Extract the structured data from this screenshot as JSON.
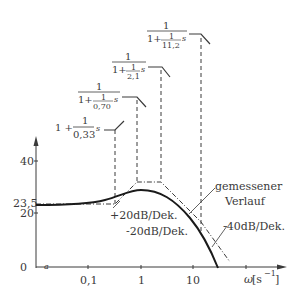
{
  "diagram": {
    "type": "bode-magnitude-plot",
    "y_axis": {
      "ticks": [
        {
          "label": "40",
          "value": 40
        },
        {
          "label": "23,5",
          "value": 23.5
        },
        {
          "label": "20",
          "value": 20
        },
        {
          "label": "0",
          "value": 0
        }
      ]
    },
    "x_axis": {
      "label_omega": "ω",
      "label_unit": "[s",
      "label_exp": "−1",
      "label_close": "]",
      "origin_mark": "a",
      "ticks": [
        {
          "label": "0,1",
          "value": 0.1
        },
        {
          "label": "1",
          "value": 1
        },
        {
          "label": "10",
          "value": 10
        }
      ]
    },
    "factors": [
      {
        "prefix": "1 +",
        "num": "1",
        "den": "0,33",
        "suffix": "s",
        "type": "zero",
        "corner": 0.33
      },
      {
        "top": "1",
        "bottom_prefix": "1+",
        "num": "1",
        "den": "0,70",
        "suffix": "s",
        "type": "pole",
        "corner": 0.7
      },
      {
        "top": "1",
        "bottom_prefix": "1+",
        "num": "1",
        "den": "2,1",
        "suffix": "s",
        "type": "pole",
        "corner": 2.1
      },
      {
        "top": "1",
        "bottom_prefix": "1+",
        "num": "1",
        "den": "11,2",
        "suffix": "s",
        "type": "pole",
        "corner": 11.2
      }
    ],
    "annotations": {
      "slope_plus20": "+20dB/Dek.",
      "slope_minus20": "-20dB/Dek.",
      "slope_minus40": "-40dB/Dek.",
      "measured_line1": "gemessener",
      "measured_line2": "Verlauf"
    },
    "colors": {
      "ink": "#3a3a3a",
      "curve": "#1a1a1a",
      "background": "#ffffff"
    }
  }
}
